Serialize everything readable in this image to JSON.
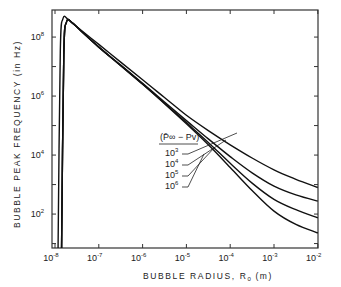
{
  "chart_data": {
    "type": "line",
    "title": "",
    "xlabel": "BUBBLE RADIUS, R",
    "xlabel_sub": "0",
    "xlabel_unit": "(m)",
    "ylabel": "BUBBLE PEAK FREQUENCY  (in Hz)",
    "xscale": "log",
    "yscale": "log",
    "xlim": [
      1e-08,
      0.01
    ],
    "ylim": [
      7,
      800000000.0
    ],
    "x_ticks": [
      {
        "base": "10",
        "exp": "-8"
      },
      {
        "base": "10",
        "exp": "-7"
      },
      {
        "base": "10",
        "exp": "-6"
      },
      {
        "base": "10",
        "exp": "-5"
      },
      {
        "base": "10",
        "exp": "-4"
      },
      {
        "base": "10",
        "exp": "-3"
      },
      {
        "base": "10",
        "exp": "-2"
      }
    ],
    "y_ticks": [
      {
        "base": "10",
        "exp": "2"
      },
      {
        "base": "10",
        "exp": "4"
      },
      {
        "base": "10",
        "exp": "6"
      },
      {
        "base": "10",
        "exp": "8"
      }
    ],
    "legend": {
      "title": "(P̄∞ − Pv)",
      "placement": "center",
      "entries": [
        {
          "base": "10",
          "exp": "3"
        },
        {
          "base": "10",
          "exp": "4"
        },
        {
          "base": "10",
          "exp": "5"
        },
        {
          "base": "10",
          "exp": "6"
        }
      ]
    },
    "series": [
      {
        "name": "10^6",
        "log_x": [
          -7.93,
          -7.88,
          -7.82,
          -7.7,
          -7.5,
          -7.0,
          -6.5,
          -6.0,
          -5.5,
          -5.0,
          -4.5,
          -4.0,
          -3.5,
          -3.0,
          -2.5,
          -2.0
        ],
        "log_y": [
          0.85,
          7.5,
          8.62,
          8.6,
          8.35,
          7.75,
          7.15,
          6.55,
          5.95,
          5.35,
          4.83,
          4.35,
          3.9,
          3.5,
          3.18,
          2.9
        ]
      },
      {
        "name": "10^5",
        "log_x": [
          -7.85,
          -7.8,
          -7.74,
          -7.62,
          -7.4,
          -7.0,
          -6.5,
          -6.0,
          -5.5,
          -5.0,
          -4.5,
          -4.0,
          -3.5,
          -3.0,
          -2.5,
          -2.0
        ],
        "log_y": [
          0.85,
          7.4,
          8.5,
          8.5,
          8.2,
          7.66,
          7.05,
          6.43,
          5.8,
          5.17,
          4.55,
          3.95,
          3.4,
          2.95,
          2.65,
          2.44
        ]
      },
      {
        "name": "10^4",
        "log_x": [
          -7.85,
          -7.8,
          -7.74,
          -7.62,
          -7.4,
          -7.0,
          -6.5,
          -6.0,
          -5.5,
          -5.0,
          -4.5,
          -4.0,
          -3.5,
          -3.0,
          -2.5,
          -2.0
        ],
        "log_y": [
          0.85,
          7.4,
          8.5,
          8.5,
          8.2,
          7.66,
          7.04,
          6.41,
          5.76,
          5.1,
          4.43,
          3.72,
          3.05,
          2.5,
          2.15,
          1.87
        ]
      },
      {
        "name": "10^3",
        "log_x": [
          -7.85,
          -7.8,
          -7.74,
          -7.62,
          -7.4,
          -7.0,
          -6.5,
          -6.0,
          -5.5,
          -5.0,
          -4.5,
          -4.0,
          -3.5,
          -3.0,
          -2.5,
          -2.0
        ],
        "log_y": [
          0.85,
          7.4,
          8.5,
          8.5,
          8.2,
          7.66,
          7.03,
          6.4,
          5.74,
          5.06,
          4.35,
          3.58,
          2.8,
          2.1,
          1.65,
          1.36
        ]
      }
    ]
  }
}
